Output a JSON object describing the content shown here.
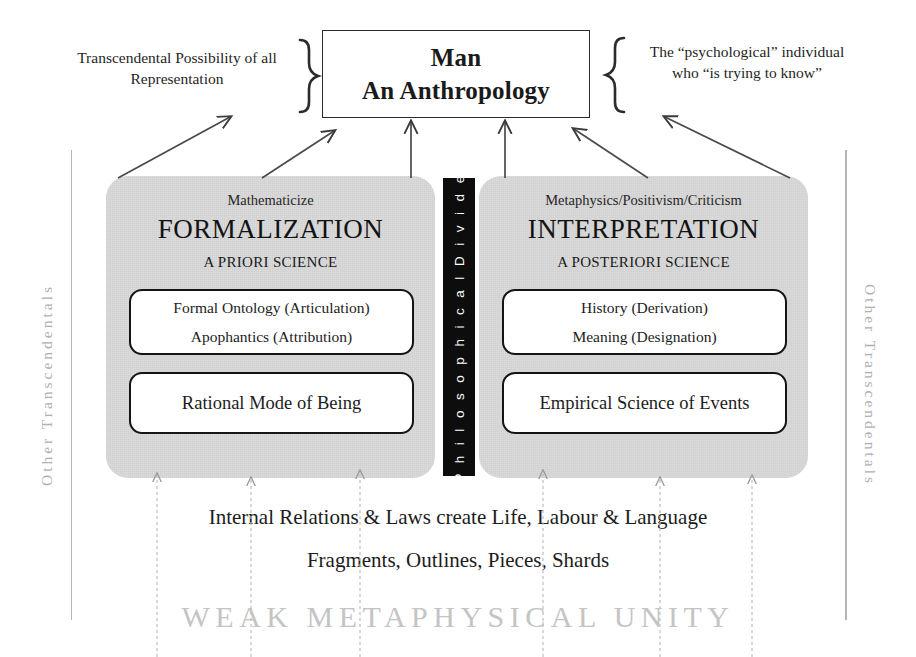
{
  "title_box": {
    "line1": "Man",
    "line2": "An Anthropology"
  },
  "annotations": {
    "left": "Transcendental Possibility of all Representation",
    "right": "The “psychological” individual who  “is trying to know”"
  },
  "panels": {
    "left": {
      "subtitle": "Mathematicize",
      "title": "FORMALIZATION",
      "science": "A PRIORI SCIENCE",
      "box_top": {
        "line1": "Formal Ontology (Articulation)",
        "line2": "Apophantics  (Attribution)"
      },
      "box_bottom": {
        "line1": "Rational Mode  of Being"
      }
    },
    "right": {
      "subtitle": "Metaphysics/Positivism/Criticism",
      "title": "INTERPRETATION",
      "science": "A POSTERIORI SCIENCE",
      "box_top": {
        "line1": "History (Derivation)",
        "line2": "Meaning (Designation)"
      },
      "box_bottom": {
        "line1": "Empirical Science of Events"
      }
    }
  },
  "divider": {
    "label": "P h i l o s o p h i c a l   D i v i d e"
  },
  "rails": {
    "left_label": "Other   Transcendentals",
    "right_label": "Other   Transcendentals"
  },
  "bottom": {
    "line1": "Internal Relations & Laws create Life, Labour & Language",
    "line2": "Fragments, Outlines, Pieces, Shards",
    "line3": "WEAK METAPHYSICAL UNITY"
  },
  "colors": {
    "panel_gray": "#d9d9d9",
    "divider_black": "#0d0d0d",
    "rail_gray": "#b0b0b0",
    "weak_unity_gray": "#c4c4c4",
    "ink": "#1a1a1a"
  }
}
